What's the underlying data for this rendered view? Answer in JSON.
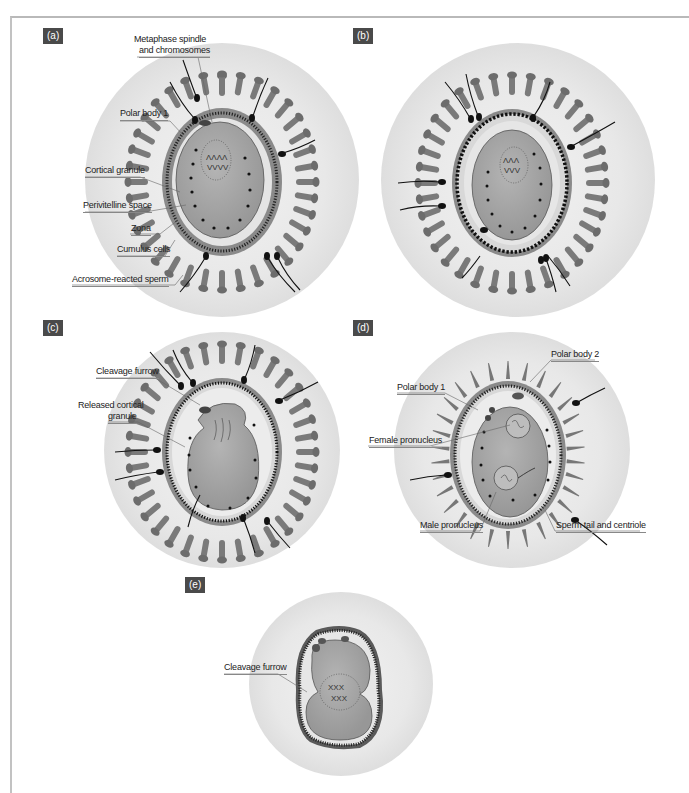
{
  "figure": {
    "panels": [
      {
        "id": "a",
        "tag": "(a)",
        "labels": [
          "Metaphase spindle",
          "and chromosomes",
          "Polar body 1",
          "Cortical granule",
          "Perivitelline space",
          "Zona",
          "Cumulus cells",
          "Acrosome-reacted sperm"
        ]
      },
      {
        "id": "b",
        "tag": "(b)",
        "labels": []
      },
      {
        "id": "c",
        "tag": "(c)",
        "labels": [
          "Cleavage furrow",
          "Released cortical",
          "granule"
        ]
      },
      {
        "id": "d",
        "tag": "(d)",
        "labels": [
          "Polar body 2",
          "Polar body 1",
          "Female pronucleus",
          "Male pronucleus",
          "Sperm tail and centriole"
        ]
      },
      {
        "id": "e",
        "tag": "(e)",
        "labels": [
          "Cleavage furrow"
        ]
      }
    ],
    "colors": {
      "tag_bg": "#4a4a4a",
      "halo": "#e6e6e6",
      "cumulus": "#7d7d7d",
      "zona": "#cfcfcf",
      "oocyte": "#a6a6a6",
      "granule": "#1a1a1a",
      "frame": "#bdbdbd"
    }
  }
}
